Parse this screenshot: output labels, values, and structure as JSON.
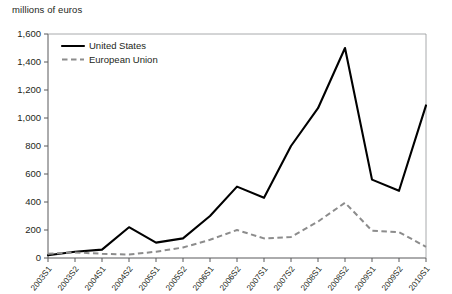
{
  "chart_data": {
    "type": "line",
    "title": "",
    "ylabel": "millions of euros",
    "xlabel": "",
    "ylim": [
      0,
      1600
    ],
    "ytick_values": [
      0,
      200,
      400,
      600,
      800,
      1000,
      1200,
      1400,
      1600
    ],
    "ytick_labels": [
      "0",
      "200",
      "400",
      "600",
      "800",
      "1,000",
      "1,200",
      "1,400",
      "1,600"
    ],
    "grid": false,
    "legend_position": "top-left",
    "categories": [
      "2003S1",
      "2003S2",
      "2004S1",
      "2004S2",
      "2005S1",
      "2005S2",
      "2006S1",
      "2006S2",
      "2007S1",
      "2007S2",
      "2008S1",
      "2008S2",
      "2009S1",
      "2009S2",
      "2010S1"
    ],
    "series": [
      {
        "name": "United States",
        "color": "#000000",
        "style": "solid",
        "values": [
          20,
          45,
          60,
          220,
          110,
          140,
          300,
          510,
          430,
          800,
          1070,
          1500,
          560,
          480,
          1090
        ]
      },
      {
        "name": "European Union",
        "color": "#8c8c8c",
        "style": "dashed",
        "values": [
          30,
          40,
          30,
          25,
          45,
          75,
          130,
          200,
          140,
          150,
          260,
          395,
          195,
          185,
          80
        ]
      }
    ]
  },
  "axis": {
    "y_title": "millions of euros"
  },
  "legend": {
    "items": [
      {
        "label": "United States"
      },
      {
        "label": "European Union"
      }
    ]
  }
}
